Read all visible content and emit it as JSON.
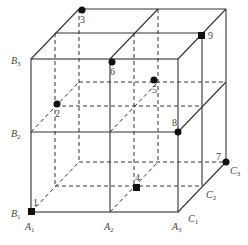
{
  "diagram": {
    "type": "2x2x2 cube grid (oblique projection)",
    "vertex_labels": {
      "A1": {
        "base": "A",
        "sub": "1"
      },
      "A2": {
        "base": "A",
        "sub": "2"
      },
      "A3": {
        "base": "A",
        "sub": "3"
      },
      "B1": {
        "base": "B",
        "sub": "1"
      },
      "B2": {
        "base": "B",
        "sub": "2"
      },
      "B3": {
        "base": "B",
        "sub": "3"
      },
      "C1": {
        "base": "C",
        "sub": "1"
      },
      "C2": {
        "base": "C",
        "sub": "2"
      },
      "C3": {
        "base": "C",
        "sub": "3"
      }
    },
    "points": [
      {
        "label": "1"
      },
      {
        "label": "2"
      },
      {
        "label": "3"
      },
      {
        "label": "4"
      },
      {
        "label": "5"
      },
      {
        "label": "6"
      },
      {
        "label": "7"
      },
      {
        "label": "8"
      },
      {
        "label": "9"
      }
    ],
    "colors": {
      "line": "#333333",
      "point": "#111111",
      "background": "#ffffff"
    }
  }
}
